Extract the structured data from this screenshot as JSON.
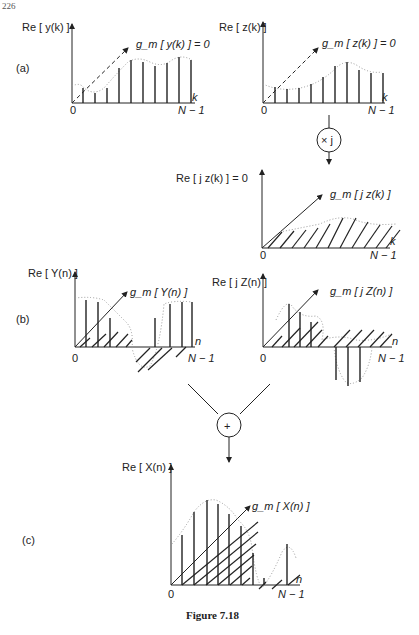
{
  "page_number": "226",
  "caption": "Figure 7.18",
  "panel_labels": {
    "a": "(a)",
    "b": "(b)",
    "c": "(c)"
  },
  "panels": {
    "y_k": {
      "y_axis_label": "Re [ y(k) ]",
      "diag_label": "g_m [ y(k) ] = 0",
      "origin": "0",
      "x_var": "k",
      "x_end": "N − 1"
    },
    "z_k": {
      "y_axis_label": "Re [ z(k) ]",
      "diag_label": "g_m [ z(k) ] = 0",
      "origin": "0",
      "x_var": "k",
      "x_end": "N − 1"
    },
    "multiply_node": {
      "symbol": "× j"
    },
    "jz_k": {
      "y_axis_label": "Re [ j z(k) ] = 0",
      "diag_label": "g_m [ j z(k) ]",
      "origin": "0",
      "x_var": "k",
      "x_end": "N − 1"
    },
    "Y_n": {
      "y_axis_label": "Re [ Y(n) ]",
      "diag_label": "g_m [ Y(n) ]",
      "origin": "0",
      "x_var": "n",
      "x_end": "N − 1"
    },
    "jZ_n": {
      "y_axis_label": "Re [ j Z(n) ]",
      "diag_label": "g_m [ j Z(n) ]",
      "origin": "0",
      "x_var": "n",
      "x_end": "N − 1"
    },
    "sum_node": {
      "symbol": "+"
    },
    "X_n": {
      "y_axis_label": "Re [ X(n) ]",
      "diag_label": "g_m [ X(n) ]",
      "origin": "0",
      "x_var": "n",
      "x_end": "N − 1"
    }
  }
}
